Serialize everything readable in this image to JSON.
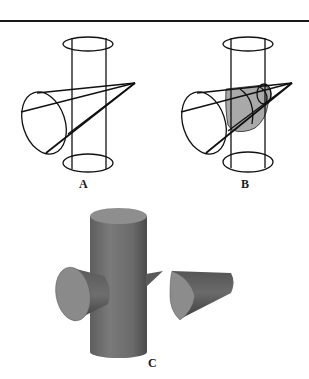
{
  "figure": {
    "panels": [
      {
        "id": "A",
        "label": "A",
        "description": "Wireframe cone piercing a vertical cylinder"
      },
      {
        "id": "B",
        "label": "B",
        "description": "Wireframe cone and cylinder with shaded intersection region"
      },
      {
        "id": "C",
        "label": "C",
        "description": "Solid-shaded cylinder with cone cut apart showing intersection"
      }
    ]
  },
  "colors": {
    "line": "#111111",
    "shade_region": "#a9a9a9",
    "solid_body": "#6e6e6e",
    "solid_face": "#8c8c8c",
    "rule": "#1a1a1a"
  }
}
